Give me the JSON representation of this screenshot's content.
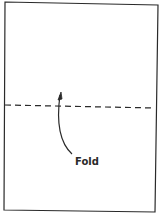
{
  "diagram": {
    "sheet": {
      "description": "rectangular sheet of paper"
    },
    "fold_line": {
      "style": "dashed"
    },
    "arrow": {
      "direction": "up toward fold line"
    },
    "label": "Fold",
    "colors": {
      "line": "#2a2a2a",
      "background": "#ffffff"
    }
  }
}
